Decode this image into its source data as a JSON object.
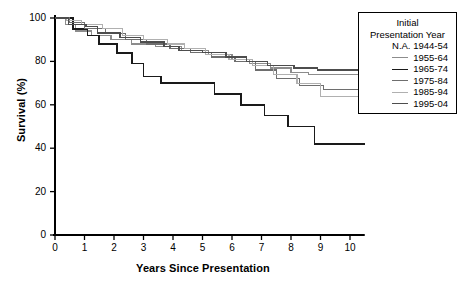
{
  "axes": {
    "ylabel": "Survival (%)",
    "xlabel": "Years Since Presentation",
    "yticks": [
      "0",
      "20",
      "40",
      "60",
      "80",
      "100"
    ],
    "xticks": [
      "0",
      "1",
      "2",
      "3",
      "4",
      "5",
      "6",
      "7",
      "8",
      "9",
      "10"
    ]
  },
  "legend": {
    "title_line1": "Initial",
    "title_line2": "Presentation Year",
    "entries": [
      {
        "label": "N.A. 1944-54",
        "color": "#000000",
        "has_line": false,
        "width": 1.2
      },
      {
        "label": "1955-64",
        "color": "#8c8c8c",
        "has_line": true,
        "width": 1.2
      },
      {
        "label": "1965-74",
        "color": "#1a1a1a",
        "has_line": true,
        "width": 1.6
      },
      {
        "label": "1975-84",
        "color": "#6e6e6e",
        "has_line": true,
        "width": 1.2
      },
      {
        "label": "1985-94",
        "color": "#b0b0b0",
        "has_line": true,
        "width": 1.2
      },
      {
        "label": "1995-04",
        "color": "#4d4d4d",
        "has_line": true,
        "width": 1.4
      }
    ]
  },
  "chart_data": {
    "type": "line",
    "title": "",
    "xlabel": "Years Since Presentation",
    "ylabel": "Survival (%)",
    "xlim": [
      0,
      10.5
    ],
    "ylim": [
      0,
      100
    ],
    "grid": false,
    "legend_position": "top-right",
    "step": "post",
    "series": [
      {
        "name": "1955-64",
        "color": "#8c8c8c",
        "width": 1.2,
        "x": [
          0,
          0.35,
          0.7,
          1.25,
          1.9,
          2.6,
          3.4,
          4.3,
          5.2,
          6.0,
          6.6,
          7.3,
          8.0,
          8.6,
          10.5
        ],
        "y": [
          100,
          97,
          94,
          92,
          90,
          88,
          87,
          85,
          83,
          81,
          79,
          77,
          75,
          74,
          74
        ]
      },
      {
        "name": "1965-74",
        "color": "#1a1a1a",
        "width": 1.6,
        "x": [
          0,
          0.6,
          1.1,
          1.5,
          2.1,
          2.6,
          3.0,
          3.6,
          4.5,
          5.4,
          6.3,
          7.1,
          7.9,
          8.8,
          10.5
        ],
        "y": [
          100,
          95,
          92,
          88,
          84,
          79,
          73,
          70,
          70,
          65,
          60,
          55,
          50,
          42,
          42
        ]
      },
      {
        "name": "1975-84",
        "color": "#6e6e6e",
        "width": 1.2,
        "x": [
          0,
          0.5,
          1.0,
          1.7,
          2.4,
          3.1,
          3.9,
          4.6,
          5.3,
          6.1,
          6.8,
          7.5,
          8.3,
          9.1,
          10.5
        ],
        "y": [
          100,
          98,
          95,
          93,
          90,
          88,
          86,
          84,
          82,
          80,
          76,
          72,
          69,
          67,
          67
        ]
      },
      {
        "name": "1985-94",
        "color": "#b0b0b0",
        "width": 1.2,
        "x": [
          0,
          0.4,
          0.9,
          1.6,
          2.3,
          3.0,
          3.8,
          4.4,
          5.1,
          5.9,
          6.7,
          7.4,
          8.2,
          9.0,
          10.5
        ],
        "y": [
          100,
          99,
          97,
          95,
          92,
          90,
          88,
          86,
          83,
          81,
          78,
          74,
          70,
          64,
          64
        ]
      },
      {
        "name": "1995-04",
        "color": "#4d4d4d",
        "width": 1.4,
        "x": [
          0,
          0.45,
          1.05,
          1.45,
          2.2,
          2.9,
          3.7,
          4.2,
          5.0,
          5.8,
          6.5,
          7.2,
          8.1,
          8.9,
          10.5
        ],
        "y": [
          100,
          97,
          96,
          93,
          91,
          89,
          87,
          85,
          84,
          82,
          80,
          78,
          77,
          76,
          76
        ]
      }
    ]
  }
}
